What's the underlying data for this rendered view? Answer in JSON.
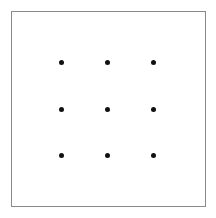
{
  "figure": {
    "canvas": {
      "width": 216,
      "height": 218,
      "background_color": "#ffffff"
    },
    "frame": {
      "label": "square border",
      "x": 11,
      "y": 11,
      "width": 195,
      "height": 196,
      "border_width": 1,
      "border_color": "#8a8a8a",
      "fill_color": "#ffffff"
    },
    "grid": {
      "rows": 3,
      "columns": 3,
      "dot_count": 9,
      "dot_diameter": 5,
      "dot_color": "#111111",
      "column_centers_x": [
        61,
        107,
        153
      ],
      "row_centers_y": [
        62,
        109,
        155
      ],
      "column_spacing": 46,
      "row_spacing": 47
    },
    "dots": [
      {
        "name": "dot-r1c1",
        "row": 1,
        "column": 1,
        "cx": 61,
        "cy": 62
      },
      {
        "name": "dot-r1c2",
        "row": 1,
        "column": 2,
        "cx": 107,
        "cy": 62
      },
      {
        "name": "dot-r1c3",
        "row": 1,
        "column": 3,
        "cx": 153,
        "cy": 62
      },
      {
        "name": "dot-r2c1",
        "row": 2,
        "column": 1,
        "cx": 61,
        "cy": 109
      },
      {
        "name": "dot-r2c2",
        "row": 2,
        "column": 2,
        "cx": 107,
        "cy": 109
      },
      {
        "name": "dot-r2c3",
        "row": 2,
        "column": 3,
        "cx": 153,
        "cy": 109
      },
      {
        "name": "dot-r3c1",
        "row": 3,
        "column": 1,
        "cx": 61,
        "cy": 155
      },
      {
        "name": "dot-r3c2",
        "row": 3,
        "column": 2,
        "cx": 107,
        "cy": 155
      },
      {
        "name": "dot-r3c3",
        "row": 3,
        "column": 3,
        "cx": 153,
        "cy": 155
      }
    ]
  }
}
